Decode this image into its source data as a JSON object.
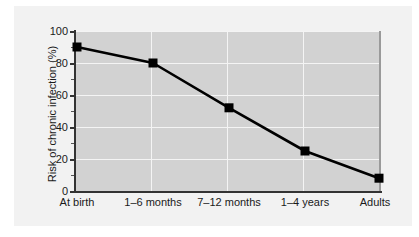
{
  "figure": {
    "background_color": "#ffffff",
    "panel_color": "#f2f2f2",
    "plot_background_color": "#d2d2d2",
    "axis_color": "#333333",
    "gridline_color": "#f4f4f4",
    "series_color": "#000000"
  },
  "chart_data": {
    "type": "line",
    "title": "",
    "subtitle": "",
    "xlabel": "",
    "ylabel": "Risk of chronic infection (%)",
    "categories": [
      "At birth",
      "1–6 months",
      "7–12 months",
      "1–4 years",
      "Adults"
    ],
    "values": [
      90,
      80,
      52,
      25,
      8
    ],
    "series": [
      {
        "name": "Risk of chronic infection",
        "values": [
          90,
          80,
          52,
          25,
          8
        ],
        "marker": "square",
        "marker_color": "#000000",
        "line_color": "#000000"
      }
    ],
    "ylim": [
      0,
      100
    ],
    "yticks": [
      0,
      20,
      40,
      60,
      80,
      100
    ],
    "ytick_labels": [
      "0",
      "20",
      "40",
      "60",
      "80",
      "100"
    ],
    "y_minor_ticks": [
      10,
      30,
      50,
      70,
      90
    ],
    "grid": true,
    "grid_axis": "both",
    "legend": false,
    "legend_position": "none"
  }
}
